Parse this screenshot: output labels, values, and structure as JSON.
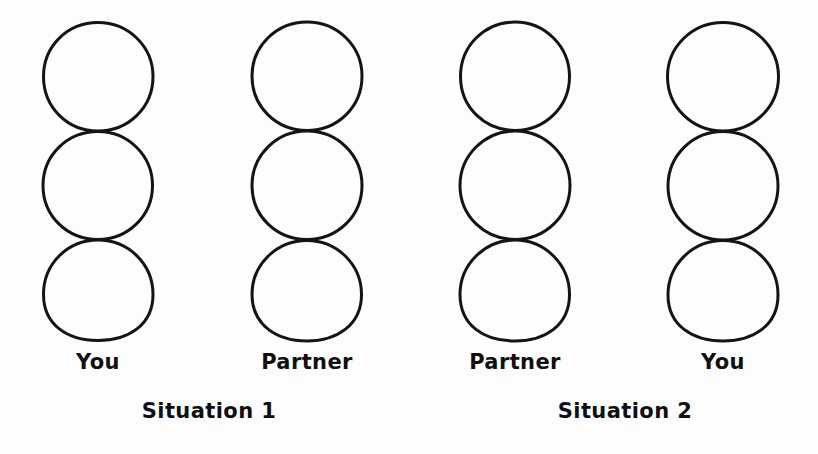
{
  "figure": {
    "background_color": "#fdfdfd",
    "stroke_color": "#141414",
    "stroke_width": 3,
    "circles_per_column": 3,
    "circle_diameter": 110,
    "columns": [
      {
        "id": "situation1-you",
        "person_label": "You",
        "center_x": 98,
        "circle_count": 3
      },
      {
        "id": "situation1-partner",
        "person_label": "Partner",
        "center_x": 307,
        "circle_count": 3
      },
      {
        "id": "situation2-partner",
        "person_label": "Partner",
        "center_x": 515,
        "circle_count": 3
      },
      {
        "id": "situation2-you",
        "person_label": "You",
        "center_x": 723,
        "circle_count": 3
      }
    ],
    "situations": [
      {
        "id": "situation-1",
        "label": "Situation 1",
        "center_x": 209
      },
      {
        "id": "situation-2",
        "label": "Situation 2",
        "center_x": 625
      }
    ]
  }
}
